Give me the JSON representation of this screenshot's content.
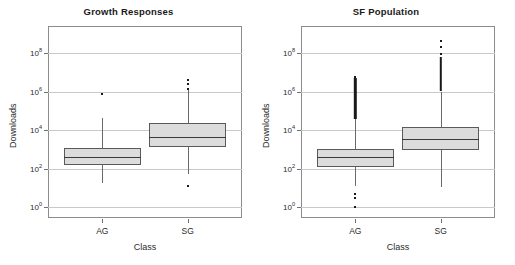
{
  "figure": {
    "width": 515,
    "height": 265,
    "background": "#ffffff",
    "box_fill": "#dcdcdc",
    "box_stroke": "#5a5a5a",
    "grid_color": "#c9c9c9",
    "frame_color": "#8c8c8c"
  },
  "chart_data": [
    {
      "type": "box",
      "title": "Growth Responses",
      "xlabel": "Class",
      "ylabel": "Downloads",
      "yscale": "log",
      "ylim": [
        1,
        1000000000
      ],
      "ytick_values": [
        1,
        100,
        10000,
        1000000,
        100000000
      ],
      "ytick_labels": [
        "10⁰",
        "10²",
        "10⁴",
        "10⁶",
        "10⁸"
      ],
      "ytick_exponents": [
        "0",
        "2",
        "4",
        "6",
        "8"
      ],
      "grid": true,
      "legend": "none",
      "categories": [
        "AG",
        "SG"
      ],
      "boxes": [
        {
          "category": "AG",
          "whisker_low": 18,
          "q1": 150,
          "median": 400,
          "q3": 1200,
          "whisker_high": 40000,
          "outliers": [
            700000
          ]
        },
        {
          "category": "SG",
          "whisker_low": 50,
          "q1": 1300,
          "median": 4500,
          "q3": 22000,
          "whisker_high": 1300000,
          "outliers": [
            1300000,
            2600000,
            4000000,
            13
          ]
        }
      ]
    },
    {
      "type": "box",
      "title": "SF Population",
      "xlabel": "Class",
      "ylabel": "Downloads",
      "yscale": "log",
      "ylim": [
        1,
        1000000000
      ],
      "ytick_values": [
        1,
        100,
        10000,
        1000000,
        100000000
      ],
      "ytick_labels": [
        "10⁰",
        "10²",
        "10⁴",
        "10⁶",
        "10⁸"
      ],
      "ytick_exponents": [
        "0",
        "2",
        "4",
        "6",
        "8"
      ],
      "grid": true,
      "legend": "none",
      "categories": [
        "AG",
        "SG"
      ],
      "boxes": [
        {
          "category": "AG",
          "whisker_low": 13,
          "q1": 120,
          "median": 400,
          "q3": 1000,
          "whisker_high": 38000,
          "outlier_band_low": 38000,
          "outlier_band_high": 5000000,
          "outliers": [
            1,
            3,
            5,
            6000000,
            5000000
          ]
        },
        {
          "category": "SG",
          "whisker_low": 11,
          "q1": 900,
          "median": 3500,
          "q3": 15000,
          "whisker_high": 1000000,
          "outlier_band_low": 1000000,
          "outlier_band_high": 60000000,
          "outliers": [
            90000000,
            200000000,
            400000000
          ]
        }
      ]
    }
  ]
}
